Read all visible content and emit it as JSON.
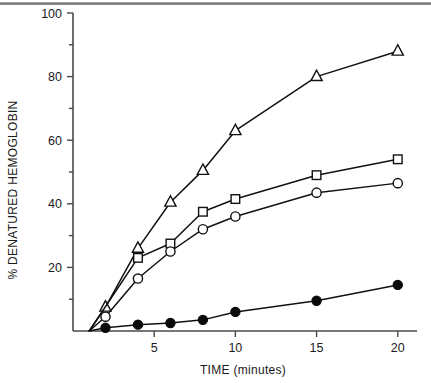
{
  "figure": {
    "background_color": "#ffffff",
    "line_color": "#111111",
    "axis_color": "#4a4a4a"
  },
  "chart_data": {
    "type": "line",
    "title": "",
    "xlabel": "TIME (minutes)",
    "ylabel": "% DENATURED HEMOGLOBIN",
    "xlim": [
      0,
      21
    ],
    "ylim": [
      0,
      100
    ],
    "grid": false,
    "legend": "none",
    "xticks": [
      5,
      10,
      15,
      20
    ],
    "xtick_labels": [
      "5",
      "10",
      "15",
      "20"
    ],
    "yticks": [
      20,
      40,
      60,
      80,
      100
    ],
    "ytick_labels": [
      "20",
      "40",
      "60",
      "80",
      "100"
    ],
    "yticks_minor": [
      10,
      30,
      50,
      70,
      90
    ],
    "series": [
      {
        "name": "open-triangle",
        "marker": "triangle-open",
        "x": [
          1,
          2,
          4,
          6,
          8,
          10,
          15,
          20
        ],
        "values": [
          0,
          7.5,
          26,
          40.5,
          50.5,
          63,
          80,
          88
        ]
      },
      {
        "name": "open-square",
        "marker": "square-open",
        "x": [
          1,
          4,
          6,
          8,
          10,
          15,
          20
        ],
        "values": [
          0,
          23,
          27.5,
          37.5,
          41.5,
          49,
          54
        ]
      },
      {
        "name": "open-circle",
        "marker": "circle-open",
        "x": [
          1,
          2,
          4,
          6,
          8,
          10,
          15,
          20
        ],
        "values": [
          0,
          4.5,
          16.5,
          25,
          32,
          36,
          43.5,
          46.5
        ]
      },
      {
        "name": "filled-circle",
        "marker": "circle-filled",
        "x": [
          1,
          2,
          4,
          6,
          8,
          10,
          15,
          20
        ],
        "values": [
          0,
          1,
          2,
          2.5,
          3.5,
          6,
          9.5,
          14.5
        ]
      }
    ]
  }
}
